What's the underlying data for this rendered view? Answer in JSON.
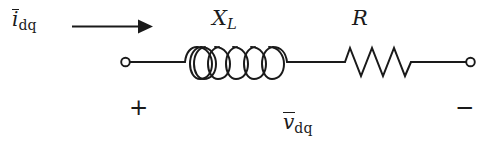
{
  "figure": {
    "kind": "circuit-diagram",
    "background_color": "#ffffff",
    "line_color": "#1a1a1a"
  },
  "labels": {
    "current": {
      "symbol": "i",
      "subscript": "dq",
      "overbar": true,
      "text": "i"
    },
    "inductor": {
      "symbol": "X",
      "subscript": "L",
      "text": "X"
    },
    "resistor": {
      "symbol": "R",
      "subscript": "",
      "text": "R"
    },
    "voltage": {
      "symbol": "v",
      "subscript": "dq",
      "overbar": true,
      "text": "v"
    },
    "polarity_positive": "+",
    "polarity_negative": "−"
  },
  "components": {
    "left_terminal": {
      "name": "open-terminal",
      "x": 125,
      "y": 62,
      "radius": 4.5
    },
    "right_terminal": {
      "name": "open-terminal",
      "x": 470,
      "y": 62,
      "radius": 4.5
    },
    "inductor": {
      "name": "inductor-coil",
      "loops": 5,
      "x_start": 190,
      "x_end": 286,
      "baseline_y": 62
    },
    "resistor": {
      "name": "resistor-zigzag",
      "cycles": 3,
      "x_start": 345,
      "x_end": 411,
      "baseline_y": 62
    },
    "current_arrow": {
      "name": "current-arrow",
      "direction": "right",
      "x_start": 72,
      "x_end": 151,
      "y": 26
    }
  },
  "subscripts": {
    "dq": "dq",
    "L": "L"
  }
}
